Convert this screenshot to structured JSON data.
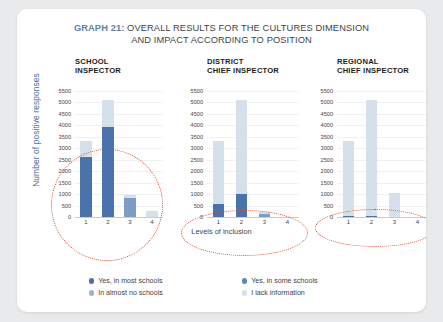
{
  "card": {
    "title_prefix": "GRAPH 21:",
    "title_line1": " OVERALL RESULTS FOR THE CULTURES DIMENSION",
    "title_line2": "AND IMPACT ACCORDING TO POSITION"
  },
  "colors": {
    "series_most": "#4a73ab",
    "series_some": "#7e9dc4",
    "series_almost_none": "#aec2d8",
    "series_lack_info": "#d6e0ea",
    "highlight_ellipse": "#d1502f",
    "axis_label": "#4b6e95",
    "title_accent": "#5d82a8",
    "text": "#3f4347"
  },
  "chart_data": {
    "type": "bar",
    "title": "GRAPH 21: OVERALL RESULTS FOR THE CULTURES DIMENSION AND IMPACT ACCORDING TO POSITION",
    "xlabel": "Levels of inclusion",
    "ylabel": "Number of positive responses",
    "ylim": [
      0,
      5750
    ],
    "yticks": [
      0,
      500,
      1000,
      1500,
      2000,
      2500,
      3000,
      3500,
      4000,
      4500,
      5000,
      5500
    ],
    "categories": [
      "1",
      "2",
      "3",
      "4"
    ],
    "grid": true,
    "legend_position": "bottom",
    "stacked": true,
    "panels": [
      {
        "name": "school-inspector",
        "label_line1": "SCHOOL",
        "label_line2": "INSPECTOR",
        "series": [
          {
            "name": "Yes, in most schools",
            "values": [
              2600,
              3900,
              0,
              0
            ]
          },
          {
            "name": "Yes, in some schools",
            "values": [
              0,
              0,
              820,
              0
            ]
          },
          {
            "name": "In almost no schools",
            "values": [
              0,
              0,
              0,
              0
            ]
          },
          {
            "name": "I lack information",
            "values": [
              700,
              1200,
              120,
              250
            ]
          }
        ],
        "totals": [
          3300,
          5100,
          940,
          250
        ],
        "highlight": true
      },
      {
        "name": "district-chief-inspector",
        "label_line1": "DISTRICT",
        "label_line2": "CHIEF INSPECTOR",
        "series": [
          {
            "name": "Yes, in most schools",
            "values": [
              550,
              1000,
              0,
              0
            ]
          },
          {
            "name": "Yes, in some schools",
            "values": [
              0,
              0,
              150,
              0
            ]
          },
          {
            "name": "In almost no schools",
            "values": [
              0,
              0,
              0,
              0
            ]
          },
          {
            "name": "I lack information",
            "values": [
              2750,
              4100,
              90,
              0
            ]
          }
        ],
        "totals": [
          3300,
          5100,
          240,
          0
        ],
        "highlight": true
      },
      {
        "name": "regional-chief-inspector",
        "label_line1": "REGIONAL",
        "label_line2": "CHIEF INSPECTOR",
        "series": [
          {
            "name": "Yes, in most schools",
            "values": [
              60,
              40,
              0,
              0
            ]
          },
          {
            "name": "Yes, in some schools",
            "values": [
              0,
              0,
              0,
              0
            ]
          },
          {
            "name": "In almost no schools",
            "values": [
              0,
              0,
              0,
              0
            ]
          },
          {
            "name": "I lack information",
            "values": [
              3240,
              5060,
              1050,
              0
            ]
          }
        ],
        "totals": [
          3300,
          5100,
          1050,
          0
        ],
        "highlight": true
      }
    ],
    "legend": [
      {
        "label": "Yes, in most schools",
        "color": "#4a73ab"
      },
      {
        "label": "Yes, in some schools",
        "color": "#5e86b8"
      },
      {
        "label": "In almost no schools",
        "color": "#9bb3cf"
      },
      {
        "label": "I lack information",
        "color": "#d6e0ea"
      }
    ]
  }
}
